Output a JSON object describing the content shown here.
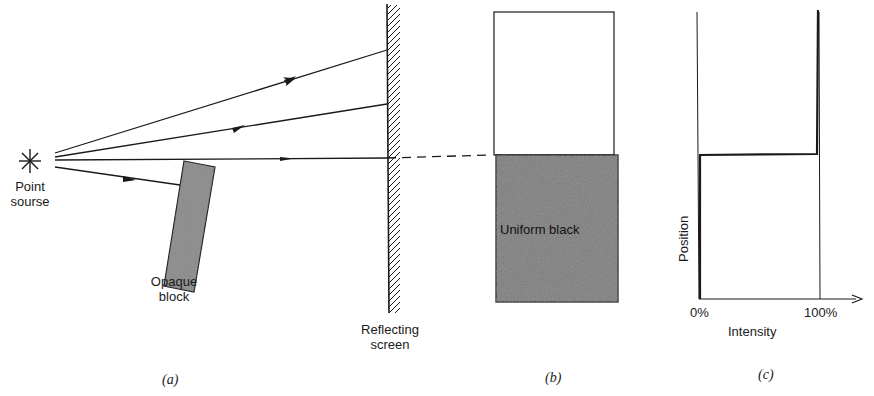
{
  "figure": {
    "panel_a": {
      "caption": "(a)",
      "source_label_line1": "Point",
      "source_label_line2": "sourse",
      "block_label_line1": "Opaque",
      "block_label_line2": "block",
      "screen_label_line1": "Reflecting",
      "screen_label_line2": "screen",
      "rays": 4
    },
    "panel_b": {
      "caption": "(b)",
      "dark_region_label": "Uniform black"
    },
    "panel_c": {
      "caption": "(c)",
      "y_axis_label": "Position",
      "x_axis_label": "Intensity",
      "x_tick_0": "0%",
      "x_tick_100": "100%"
    }
  },
  "colors": {
    "ink": "#1a1a1a",
    "shade": "#7a7a7a",
    "background": "#ffffff"
  }
}
